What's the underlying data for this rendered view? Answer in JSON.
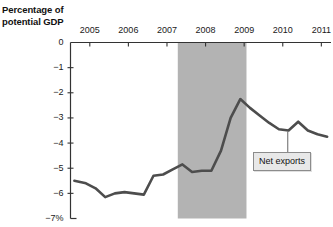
{
  "chart_data": {
    "type": "line",
    "title": "Percentage of potential GDP",
    "xlabel": "",
    "ylabel": "Percentage of potential GDP",
    "ylim": [
      -7,
      0
    ],
    "xlim": [
      2004.5,
      2011.25
    ],
    "grid": false,
    "legend_position": "inline-annotation",
    "y_ticks": [
      0,
      -1,
      -2,
      -3,
      -4,
      -5,
      -6,
      -7
    ],
    "y_tick_labels": [
      "0",
      "−1",
      "−2",
      "−3",
      "−4",
      "−5",
      "−6",
      "−7%"
    ],
    "x_ticks": [
      2005,
      2006,
      2007,
      2008,
      2009,
      2010,
      2011
    ],
    "x_tick_labels": [
      "2005",
      "2006",
      "2007",
      "2008",
      "2009",
      "2010",
      "2011"
    ],
    "series": [
      {
        "name": "Net exports",
        "color": "#4d4d4d",
        "x": [
          2004.6,
          2004.9,
          2005.15,
          2005.4,
          2005.65,
          2005.9,
          2006.15,
          2006.4,
          2006.65,
          2006.9,
          2007.15,
          2007.4,
          2007.65,
          2007.9,
          2008.15,
          2008.4,
          2008.65,
          2008.9,
          2009.15,
          2009.4,
          2009.65,
          2009.9,
          2010.15,
          2010.4,
          2010.65,
          2010.9,
          2011.15
        ],
        "values": [
          -5.5,
          -5.6,
          -5.8,
          -6.15,
          -6.0,
          -5.95,
          -6.0,
          -6.05,
          -5.3,
          -5.25,
          -5.05,
          -4.85,
          -5.15,
          -5.1,
          -5.1,
          -4.3,
          -3.0,
          -2.25,
          -2.6,
          -2.9,
          -3.2,
          -3.45,
          -3.5,
          -3.15,
          -3.5,
          -3.65,
          -3.75
        ]
      }
    ],
    "shaded_region": {
      "label": "recession",
      "x_start": 2007.28,
      "x_end": 2009.06,
      "color": "#b3b3b3"
    },
    "annotations": [
      {
        "name": "net-exports-callout",
        "text": "Net exports",
        "points_to_x": 2010.13,
        "points_to_y": -3.5
      }
    ]
  },
  "axis": {
    "title_line1": "Percentage of",
    "title_line2": "potential GDP"
  },
  "annotation": {
    "net_exports_label": "Net exports"
  }
}
